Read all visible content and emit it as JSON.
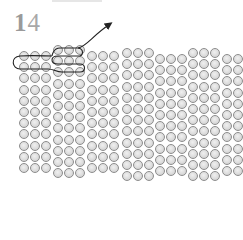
{
  "step": {
    "number": "14",
    "digit1": "1",
    "digit2": "4"
  },
  "diagram": {
    "type": "bead-weaving-stitch",
    "bead_color": "#dcdcdc",
    "bead_border": "#8c8c8c",
    "thread_color": "#222222",
    "bead_size": 11.2,
    "column_groups": [
      {
        "x": 19,
        "top": 51,
        "rows": 11,
        "cols": 3
      },
      {
        "x": 53,
        "top": 45,
        "rows": 12,
        "cols": 3
      },
      {
        "x": 87,
        "top": 51,
        "rows": 11,
        "cols": 3
      },
      {
        "x": 122,
        "top": 48,
        "rows": 12,
        "cols": 3
      },
      {
        "x": 155,
        "top": 54,
        "rows": 11,
        "cols": 3
      },
      {
        "x": 188,
        "top": 48,
        "rows": 12,
        "cols": 3
      },
      {
        "x": 222,
        "top": 54,
        "rows": 11,
        "cols": 2
      }
    ],
    "thread_path_label": "thread-path",
    "arrow_direction": "up-right"
  }
}
